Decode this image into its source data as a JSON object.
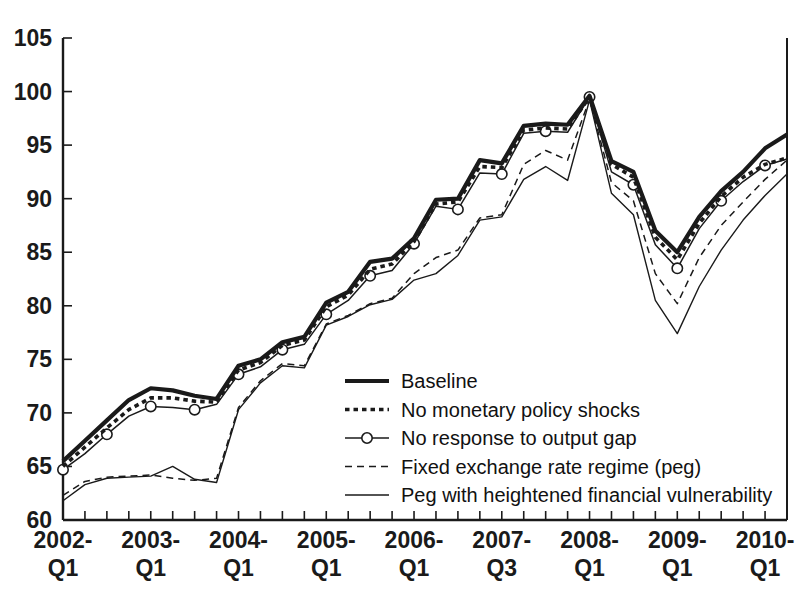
{
  "chart_data": {
    "type": "line",
    "title": "",
    "subtitle": "",
    "xlabel": "",
    "ylabel": "",
    "ylim": [
      60,
      105
    ],
    "ytick_values": [
      60,
      65,
      70,
      75,
      80,
      85,
      90,
      95,
      100,
      105
    ],
    "ytick_labels": [
      "60",
      "65",
      "70",
      "75",
      "80",
      "85",
      "90",
      "95",
      "100",
      "105"
    ],
    "grid": false,
    "legend_position": "center-right-inside",
    "x": [
      "2002-Q1",
      "2002-Q2",
      "2002-Q3",
      "2002-Q4",
      "2003-Q1",
      "2003-Q2",
      "2003-Q3",
      "2003-Q4",
      "2004-Q1",
      "2004-Q2",
      "2004-Q3",
      "2004-Q4",
      "2005-Q1",
      "2005-Q2",
      "2005-Q3",
      "2005-Q4",
      "2006-Q1",
      "2006-Q2",
      "2006-Q3",
      "2006-Q4",
      "2007-Q1",
      "2007-Q2",
      "2007-Q3",
      "2007-Q4",
      "2008-Q1",
      "2008-Q2",
      "2008-Q3",
      "2008-Q4",
      "2009-Q1",
      "2009-Q2",
      "2009-Q3",
      "2009-Q4",
      "2010-Q1",
      "2010-Q2"
    ],
    "xtick_labels": [
      {
        "line1": "2002-",
        "line2": "Q1",
        "index": 0
      },
      {
        "line1": "2003-",
        "line2": "Q1",
        "index": 4
      },
      {
        "line1": "2004-",
        "line2": "Q1",
        "index": 8
      },
      {
        "line1": "2005-",
        "line2": "Q1",
        "index": 12
      },
      {
        "line1": "2006-",
        "line2": "Q1",
        "index": 16
      },
      {
        "line1": "2007-",
        "line2": "Q3",
        "index": 20
      },
      {
        "line1": "2008-",
        "line2": "Q1",
        "index": 24
      },
      {
        "line1": "2009-",
        "line2": "Q1",
        "index": 28
      },
      {
        "line1": "2010-",
        "line2": "Q1",
        "index": 32
      }
    ],
    "series": [
      {
        "name": "Baseline",
        "style": "thick-solid",
        "values": [
          65.5,
          67.4,
          69.3,
          71.2,
          72.3,
          72.1,
          71.6,
          71.3,
          74.4,
          75.0,
          76.6,
          77.1,
          80.3,
          81.3,
          84.1,
          84.4,
          86.3,
          89.9,
          90.0,
          93.6,
          93.3,
          96.8,
          97.0,
          96.9,
          99.6,
          93.5,
          92.5,
          87.0,
          85.0,
          88.3,
          90.7,
          92.5,
          94.7,
          96.0
        ]
      },
      {
        "name": "No monetary policy shocks",
        "style": "thick-dotted",
        "values": [
          65.0,
          66.8,
          68.6,
          70.3,
          71.4,
          71.4,
          71.1,
          71.0,
          74.0,
          74.7,
          76.3,
          76.8,
          79.9,
          81.0,
          83.4,
          83.9,
          86.0,
          89.5,
          89.7,
          93.0,
          92.9,
          96.4,
          96.6,
          96.5,
          99.5,
          93.2,
          92.0,
          86.4,
          84.3,
          87.7,
          90.2,
          92.0,
          93.2,
          93.8
        ]
      },
      {
        "name": "No response to output gap",
        "style": "thin-solid-markers",
        "values": [
          64.7,
          66.2,
          68.0,
          69.7,
          70.6,
          70.5,
          70.3,
          70.8,
          73.6,
          74.3,
          75.9,
          76.4,
          79.2,
          80.5,
          82.8,
          83.3,
          85.8,
          89.3,
          89.0,
          92.4,
          92.3,
          96.1,
          96.3,
          96.2,
          99.5,
          92.5,
          91.3,
          85.7,
          83.5,
          87.2,
          89.8,
          91.6,
          93.1,
          93.7
        ]
      },
      {
        "name": "Fixed exchange rate regime (peg)",
        "style": "thin-dashed",
        "values": [
          62.3,
          63.6,
          64.0,
          64.1,
          64.2,
          63.9,
          63.7,
          63.9,
          70.5,
          73.0,
          74.6,
          74.4,
          78.3,
          79.1,
          80.2,
          80.7,
          83.0,
          84.5,
          85.2,
          88.2,
          88.5,
          93.2,
          94.5,
          93.6,
          99.3,
          91.5,
          89.8,
          83.0,
          80.2,
          84.5,
          87.5,
          89.7,
          91.8,
          93.6
        ]
      },
      {
        "name": "Peg with heightened financial vulnerability",
        "style": "thin-solid",
        "values": [
          61.8,
          63.3,
          63.9,
          64.0,
          64.1,
          65.0,
          63.8,
          63.5,
          70.3,
          72.8,
          74.4,
          74.2,
          78.2,
          79.0,
          80.1,
          80.6,
          82.4,
          83.0,
          84.7,
          88.0,
          88.3,
          91.8,
          93.0,
          91.7,
          99.2,
          90.5,
          88.5,
          80.5,
          77.4,
          81.8,
          85.2,
          88.0,
          90.3,
          92.3
        ]
      }
    ]
  },
  "legend": {
    "entries": [
      {
        "label": "Baseline",
        "style": "thick-solid"
      },
      {
        "label": "No monetary policy shocks",
        "style": "thick-dotted"
      },
      {
        "label": "No response to output gap",
        "style": "thin-solid-markers"
      },
      {
        "label": "Fixed exchange rate regime (peg)",
        "style": "thin-dashed"
      },
      {
        "label": "Peg with heightened financial vulnerability",
        "style": "thin-solid"
      }
    ]
  },
  "colors": {
    "ink": "#1a1a1a",
    "background": "#ffffff"
  }
}
